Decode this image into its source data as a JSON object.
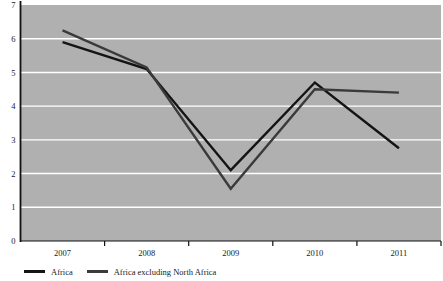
{
  "chart_data": {
    "type": "line",
    "title": "",
    "xlabel": "",
    "ylabel": "",
    "categories": [
      "2007",
      "2008",
      "2009",
      "2010",
      "2011"
    ],
    "x": [
      2007,
      2008,
      2009,
      2010,
      2011
    ],
    "ylim": [
      0,
      7
    ],
    "ytick_values": [
      0,
      1,
      2,
      3,
      4,
      5,
      6,
      7
    ],
    "ytick_labels": [
      "0",
      "1",
      "2",
      "3",
      "4",
      "5",
      "6",
      "7"
    ],
    "grid": true,
    "grid_color": "#ffffff",
    "plot_background": "#b0b0b0",
    "legend_position": "bottom-left",
    "series": [
      {
        "name": "Africa",
        "color": "#141414",
        "values": [
          5.9,
          5.1,
          2.1,
          4.7,
          2.75
        ]
      },
      {
        "name": "Africa excluding North Africa",
        "color": "#3a3a3a",
        "values": [
          6.25,
          5.15,
          1.55,
          4.5,
          4.4
        ]
      }
    ]
  },
  "axis": {
    "y_axis_color": "#111111",
    "x_axis_color": "#111111",
    "tick_color": "#111111"
  },
  "legend": {
    "items": [
      {
        "label": "Africa",
        "color": "#141414"
      },
      {
        "label": "Africa excluding North Africa",
        "color": "#3a3a3a"
      }
    ]
  }
}
